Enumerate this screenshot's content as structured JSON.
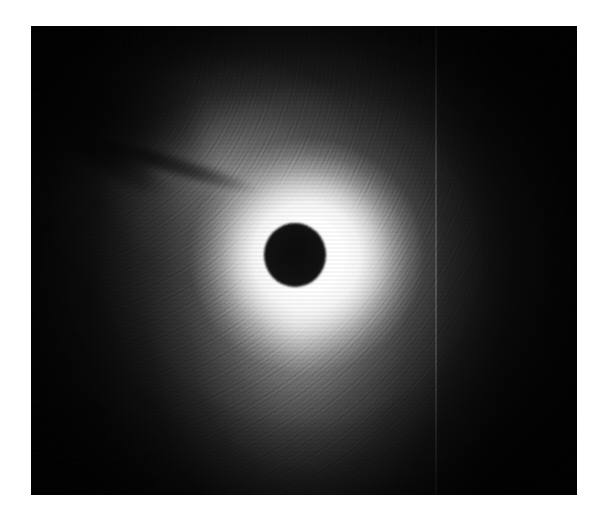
{
  "page": {
    "background_color": "#ffffff",
    "width": 601,
    "height": 516
  },
  "image": {
    "kind": "coronagraph-photograph",
    "caption": "",
    "frame": {
      "left": 31,
      "top": 26,
      "width": 546,
      "height": 469
    },
    "palette": {
      "paper": "#ffffff",
      "sky_background": "#0a0a0a",
      "corona_bright": "#ffffff",
      "corona_mid": "#8a8a8a",
      "corona_faint": "#3c3c3c",
      "occulter": "#101010"
    },
    "features": [
      {
        "name": "occulting-disk",
        "label": "Occulting disk",
        "center_x": 295,
        "center_y": 255,
        "radius_px": 31,
        "color": "#101010"
      },
      {
        "name": "inner-corona",
        "label": "Saturated inner corona",
        "center_x": 295,
        "center_y": 255,
        "radius_px": 118,
        "color": "#ffffff"
      },
      {
        "name": "outer-corona",
        "label": "Outer corona halo",
        "center_x": 295,
        "center_y": 255,
        "radius_px": 300,
        "color": "#6e6e6e"
      },
      {
        "name": "dark-filament",
        "label": "Dark filament streak (upper left)",
        "start_x": 83,
        "start_y": 130,
        "end_x": 256,
        "end_y": 192,
        "color": "#000000"
      },
      {
        "name": "detector-seam",
        "label": "Vertical detector seam",
        "x": 435,
        "color": "#2a2a2a"
      }
    ]
  }
}
